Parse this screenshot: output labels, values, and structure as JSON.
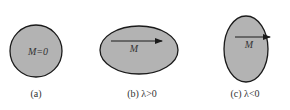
{
  "figure": {
    "panels": [
      {
        "id": "a",
        "shape": "circle",
        "inner_label": "M=0",
        "caption": "(a)",
        "arrow": false
      },
      {
        "id": "b",
        "shape": "horizontal-ellipse",
        "inner_label": "M",
        "caption": "(b) λ>0",
        "arrow": true
      },
      {
        "id": "c",
        "shape": "vertical-ellipse",
        "inner_label": "M",
        "caption": "(c) λ<0",
        "arrow": true
      }
    ],
    "colors": {
      "fill": "#b3b3b3",
      "stroke": "#1a1a1a",
      "text": "#333333"
    }
  }
}
